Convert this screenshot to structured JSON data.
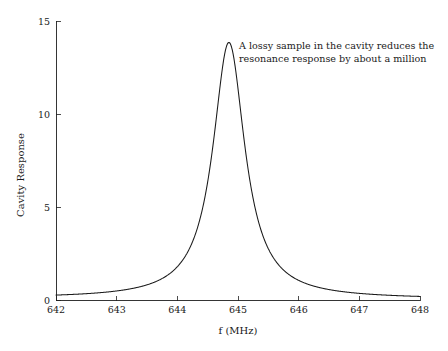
{
  "chart_data": {
    "type": "line",
    "title": "",
    "xlabel": "f (MHz)",
    "ylabel": "Cavity Response",
    "xlim": [
      642,
      648
    ],
    "ylim": [
      0,
      15
    ],
    "grid": false,
    "legend": null,
    "xticks": [
      642,
      643,
      644,
      645,
      646,
      647,
      648
    ],
    "xtick_labels": [
      "642",
      "643",
      "644",
      "645",
      "646",
      "647",
      "648"
    ],
    "yticks": [
      0,
      5,
      10,
      15
    ],
    "ytick_labels": [
      "0",
      "5",
      "10",
      "15"
    ],
    "annotations": [
      {
        "name": "lossy-sample-note",
        "line1": "A lossy sample in the cavity reduces the",
        "line2": "resonance response by about a million",
        "x": 645.0,
        "y": 13.5
      }
    ],
    "series": [
      {
        "name": "cavity-response",
        "color": "#1a1a1a",
        "peak_x": 644.85,
        "peak_y": 13.75,
        "fwhm": 0.64,
        "shape": "lorentzian",
        "x": [
          642.0,
          642.1,
          642.2,
          642.3,
          642.4,
          642.5,
          642.6,
          642.7,
          642.8,
          642.9,
          643.0,
          643.1,
          643.2,
          643.3,
          643.4,
          643.5,
          643.6,
          643.7,
          643.8,
          643.9,
          644.0,
          644.1,
          644.2,
          644.3,
          644.4,
          644.5,
          644.55,
          644.6,
          644.65,
          644.7,
          644.75,
          644.8,
          644.85,
          644.9,
          644.95,
          645.0,
          645.05,
          645.1,
          645.15,
          645.2,
          645.3,
          645.4,
          645.5,
          645.6,
          645.7,
          645.8,
          645.9,
          646.0,
          646.2,
          646.4,
          646.6,
          646.8,
          647.0,
          647.2,
          647.4,
          647.6,
          647.8,
          648.0
        ],
        "y": [
          0.12,
          0.13,
          0.14,
          0.15,
          0.17,
          0.18,
          0.2,
          0.22,
          0.25,
          0.28,
          0.31,
          0.36,
          0.41,
          0.48,
          0.57,
          0.68,
          0.83,
          1.03,
          1.31,
          1.71,
          2.29,
          3.17,
          4.51,
          6.51,
          9.1,
          11.76,
          12.75,
          13.43,
          13.73,
          13.75,
          13.75,
          13.75,
          13.75,
          13.62,
          13.25,
          12.56,
          11.62,
          10.49,
          9.31,
          8.15,
          6.15,
          4.6,
          3.47,
          2.67,
          2.1,
          1.68,
          1.37,
          1.14,
          0.83,
          0.63,
          0.5,
          0.41,
          0.35,
          0.3,
          0.26,
          0.23,
          0.21,
          0.19
        ]
      }
    ]
  },
  "axes": {
    "ylabel_text": "Cavity Response",
    "xlabel_text": "f (MHz)"
  }
}
